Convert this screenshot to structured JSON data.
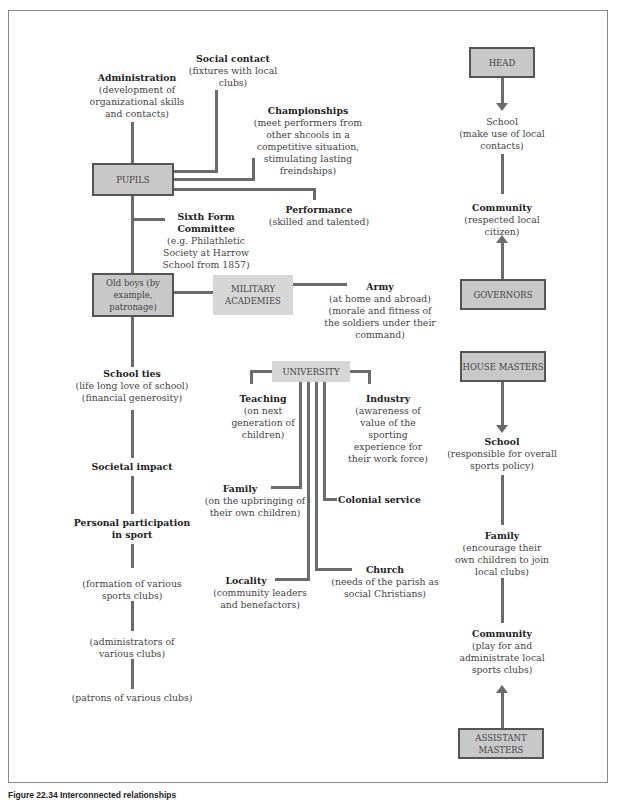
{
  "nodes": {
    "pupils": "PUPILS",
    "old_boys": "Old boys (by example, patronage)",
    "military": "MILITARY ACADEMIES",
    "university": "UNIVERSITY",
    "head": "HEAD",
    "governors": "GOVERNORS",
    "house_masters": "HOUSE MASTERS",
    "assistant_masters": "ASSISTANT MASTERS"
  },
  "labels": {
    "administration": {
      "title": "Administration",
      "desc": "(development of organizational skills and contacts)"
    },
    "social_contact": {
      "title": "Social contact",
      "desc": "(fixtures with local clubs)"
    },
    "championships": {
      "title": "Championships",
      "desc": "(meet performers from other shcools in a competitive situation, stimulating lasting freindships)"
    },
    "performance": {
      "title": "Performance",
      "desc": "(skilled and talented)"
    },
    "sixth_form": {
      "title": "Sixth Form Committee",
      "desc": "(e.g. Philathletic Society at Harrow School from 1857)"
    },
    "army": {
      "title": "Army",
      "desc": "(at home and abroad) (morale and fitness of the soldiers under their command)"
    },
    "school_ties": {
      "title": "School ties",
      "desc": "(life long love of school) (financial generosity)"
    },
    "societal_impact": {
      "title": "Societal impact"
    },
    "personal_participation": {
      "title": "Personal participation in sport"
    },
    "formation": {
      "desc": "(formation of various sports clubs)"
    },
    "administrators": {
      "desc": "(administrators of various clubs)"
    },
    "patrons": {
      "desc": "(patrons of various clubs)"
    },
    "teaching": {
      "title": "Teaching",
      "desc": "(on next generation of children)"
    },
    "industry": {
      "title": "Industry",
      "desc": "(awareness of value of the sporting experience for their work force)"
    },
    "family_uni": {
      "title": "Family",
      "desc": "(on the upbringing of their own children)"
    },
    "colonial": {
      "title": "Colonial service"
    },
    "locality": {
      "title": "Locality",
      "desc": "(community leaders and benefactors)"
    },
    "church": {
      "title": "Church",
      "desc": "(needs of the parish as social Christians)"
    },
    "school_head": {
      "title": "School",
      "desc": "(make use of local contacts)"
    },
    "community_gov": {
      "title": "Community",
      "desc": "(respected local citizen)"
    },
    "school_hm": {
      "title": "School",
      "desc": "(responsible for overall sports policy)"
    },
    "family_hm": {
      "title": "Family",
      "desc": "(encourage their own children to join local clubs)"
    },
    "community_am": {
      "title": "Community",
      "desc": "(play for and administrate local sports clubs)"
    }
  },
  "caption": "Figure 22.34 Interconnected relationships"
}
